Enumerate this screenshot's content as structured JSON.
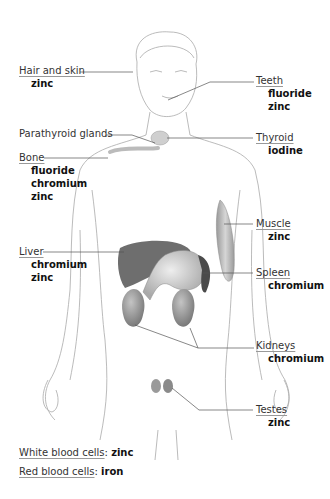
{
  "diagram": {
    "type": "anatomical-label-diagram",
    "labels": [
      {
        "organ": "Hair and skin",
        "minerals": [
          "zinc"
        ]
      },
      {
        "organ": "Teeth",
        "minerals": [
          "fluoride",
          "zinc"
        ]
      },
      {
        "organ": "Parathyroid glands",
        "minerals": []
      },
      {
        "organ": "Thyroid",
        "minerals": [
          "iodine"
        ]
      },
      {
        "organ": "Bone",
        "minerals": [
          "fluoride",
          "chromium",
          "zinc"
        ]
      },
      {
        "organ": "Muscle",
        "minerals": [
          "zinc"
        ]
      },
      {
        "organ": "Liver",
        "minerals": [
          "chromium",
          "zinc"
        ]
      },
      {
        "organ": "Spleen",
        "minerals": [
          "chromium"
        ]
      },
      {
        "organ": "Kidneys",
        "minerals": [
          "chromium"
        ]
      },
      {
        "organ": "Testes",
        "minerals": [
          "zinc"
        ]
      }
    ],
    "footer": [
      {
        "name": "White blood cells",
        "sep": ":",
        "value": "zinc"
      },
      {
        "name": "Red blood cells",
        "sep": ":",
        "value": "iron"
      }
    ],
    "colors": {
      "outline": "#aaaaaa",
      "leader": "#555555",
      "liver": "#6e6e6e",
      "stomach": "#c8c8c8",
      "spleen": "#4a4a4a",
      "kidney": "#9a9a9a",
      "muscle": "#b8b8b8"
    }
  }
}
